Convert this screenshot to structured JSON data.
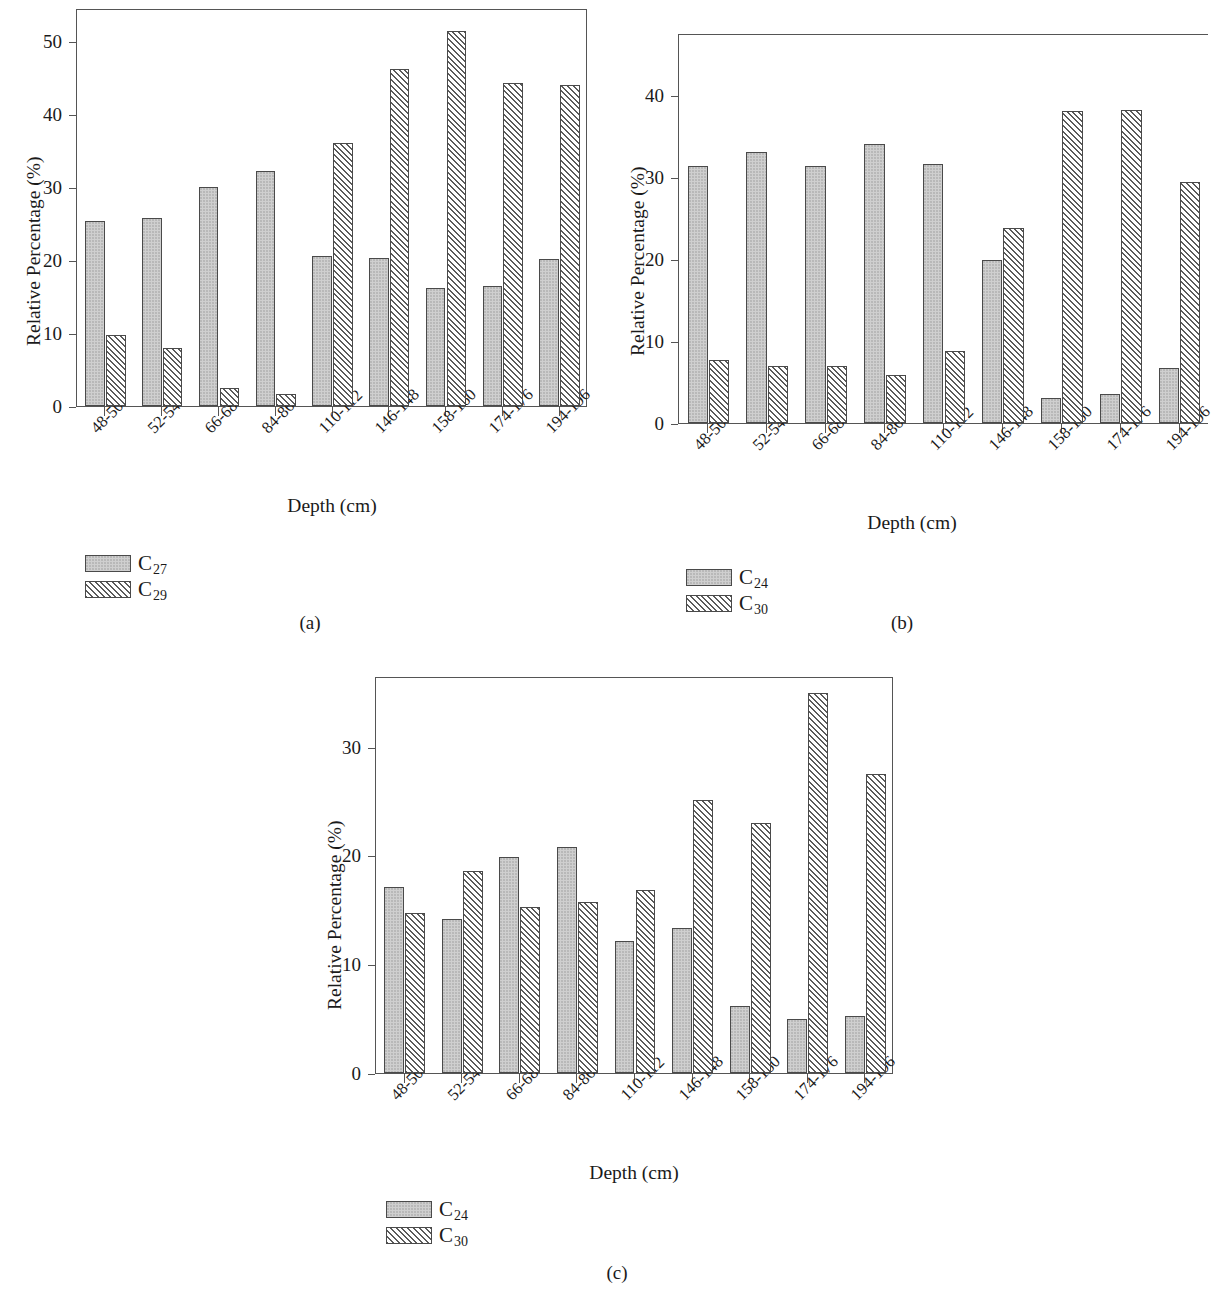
{
  "figure": {
    "axis_title_x": "Depth (cm)",
    "axis_title_y": "Relative Percentage (%)",
    "categories": [
      "48-50",
      "52-54",
      "66-68",
      "84-86",
      "110-112",
      "146-148",
      "158-160",
      "174-176",
      "194-196"
    ]
  },
  "panels": [
    {
      "caption": "(a)",
      "legend": [
        {
          "label": "C",
          "sub": "27",
          "style": "solid"
        },
        {
          "label": "C",
          "sub": "29",
          "style": "hatch"
        }
      ],
      "yticks": [
        "0",
        "10",
        "20",
        "30",
        "40",
        "50"
      ]
    },
    {
      "caption": "(b)",
      "legend": [
        {
          "label": "C",
          "sub": "24",
          "style": "solid"
        },
        {
          "label": "C",
          "sub": "30",
          "style": "hatch"
        }
      ],
      "yticks": [
        "0",
        "10",
        "20",
        "30",
        "40"
      ]
    },
    {
      "caption": "(c)",
      "legend": [
        {
          "label": "C",
          "sub": "24",
          "style": "solid"
        },
        {
          "label": "C",
          "sub": "30",
          "style": "hatch"
        }
      ],
      "yticks": [
        "0",
        "10",
        "20",
        "30"
      ]
    }
  ],
  "chart_data": [
    {
      "type": "bar",
      "panel": "(a)",
      "title": "",
      "xlabel": "Depth (cm)",
      "ylabel": "Relative Percentage (%)",
      "categories": [
        "48-50",
        "52-54",
        "66-68",
        "84-86",
        "110-112",
        "146-148",
        "158-160",
        "174-176",
        "194-196"
      ],
      "series": [
        {
          "name": "C27",
          "values": [
            25.4,
            25.8,
            30.0,
            32.2,
            20.6,
            20.3,
            16.2,
            16.4,
            20.1
          ]
        },
        {
          "name": "C29",
          "values": [
            9.7,
            7.9,
            2.5,
            1.6,
            36.0,
            46.1,
            51.3,
            44.3,
            44.0
          ]
        }
      ],
      "ylim": [
        0,
        54.5
      ],
      "yticks": [
        0,
        10,
        20,
        30,
        40,
        50
      ],
      "grid": false,
      "legend_position": "below-left"
    },
    {
      "type": "bar",
      "panel": "(b)",
      "title": "",
      "xlabel": "Depth (cm)",
      "ylabel": "Relative Percentage (%)",
      "categories": [
        "48-50",
        "52-54",
        "66-68",
        "84-86",
        "110-112",
        "146-148",
        "158-160",
        "174-176",
        "194-196"
      ],
      "series": [
        {
          "name": "C24",
          "values": [
            31.3,
            33.0,
            31.3,
            34.0,
            31.6,
            19.9,
            3.0,
            3.5,
            6.7
          ]
        },
        {
          "name": "C30",
          "values": [
            7.7,
            6.9,
            6.9,
            5.8,
            8.8,
            23.8,
            38.0,
            38.1,
            29.4
          ]
        }
      ],
      "ylim": [
        0,
        47.5
      ],
      "yticks": [
        0,
        10,
        20,
        30,
        40
      ],
      "grid": false,
      "legend_position": "below-left"
    },
    {
      "type": "bar",
      "panel": "(c)",
      "title": "",
      "xlabel": "Depth (cm)",
      "ylabel": "Relative Percentage (%)",
      "categories": [
        "48-50",
        "52-54",
        "66-68",
        "84-86",
        "110-112",
        "146-148",
        "158-160",
        "174-176",
        "194-196"
      ],
      "series": [
        {
          "name": "C24",
          "values": [
            17.1,
            14.2,
            19.9,
            20.8,
            12.1,
            13.3,
            6.2,
            5.0,
            5.2
          ]
        },
        {
          "name": "C30",
          "values": [
            14.7,
            18.6,
            15.3,
            15.7,
            16.8,
            25.1,
            23.0,
            34.9,
            27.5
          ]
        }
      ],
      "ylim": [
        0,
        36.5
      ],
      "yticks": [
        0,
        10,
        20,
        30
      ],
      "grid": false,
      "legend_position": "below-left"
    }
  ]
}
